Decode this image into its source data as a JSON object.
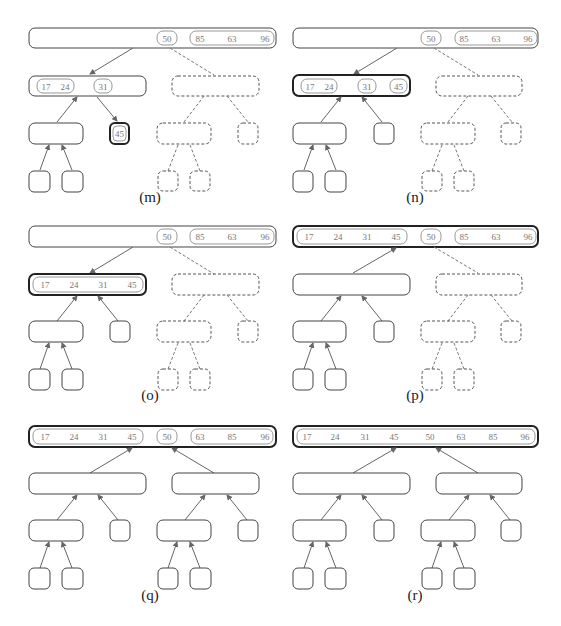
{
  "figure": {
    "colors": {
      "stroke": "#444444",
      "value_text": "#777777",
      "run_stroke": "#999999",
      "arrow": "#666666"
    }
  },
  "panels": [
    {
      "label": "(m)",
      "root": {
        "runs": [
          [
            "50"
          ],
          [
            "85",
            "63",
            "96"
          ]
        ],
        "highlight": false
      },
      "left_node": {
        "runs": [
          [
            "17",
            "24"
          ],
          [
            "31"
          ]
        ],
        "highlight": false
      },
      "active_leaf": {
        "value": "45",
        "highlight": true
      },
      "right_subtree": "dashed"
    },
    {
      "label": "(n)",
      "root": {
        "runs": [
          [
            "50"
          ],
          [
            "85",
            "63",
            "96"
          ]
        ],
        "highlight": false
      },
      "left_node": {
        "runs": [
          [
            "17",
            "24"
          ],
          [
            "31"
          ],
          [
            "45"
          ]
        ],
        "highlight": true
      },
      "right_subtree": "dashed"
    },
    {
      "label": "(o)",
      "root": {
        "runs": [
          [
            "50"
          ],
          [
            "85",
            "63",
            "96"
          ]
        ],
        "highlight": false
      },
      "left_node": {
        "runs": [
          [
            "17",
            "24",
            "31",
            "45"
          ]
        ],
        "highlight": true
      },
      "right_subtree": "dashed"
    },
    {
      "label": "(p)",
      "root": {
        "runs": [
          [
            "17",
            "24",
            "31",
            "45"
          ],
          [
            "50"
          ],
          [
            "85",
            "63",
            "96"
          ]
        ],
        "highlight": true
      },
      "right_subtree": "dashed"
    },
    {
      "label": "(q)",
      "root": {
        "runs": [
          [
            "17",
            "24",
            "31",
            "45"
          ],
          [
            "50"
          ],
          [
            "63",
            "85",
            "96"
          ]
        ],
        "highlight": true
      },
      "right_subtree": "solid"
    },
    {
      "label": "(r)",
      "root": {
        "runs": [
          [
            "17",
            "24",
            "31",
            "45",
            "50",
            "63",
            "85",
            "96"
          ]
        ],
        "highlight": true
      },
      "right_subtree": "solid"
    }
  ]
}
